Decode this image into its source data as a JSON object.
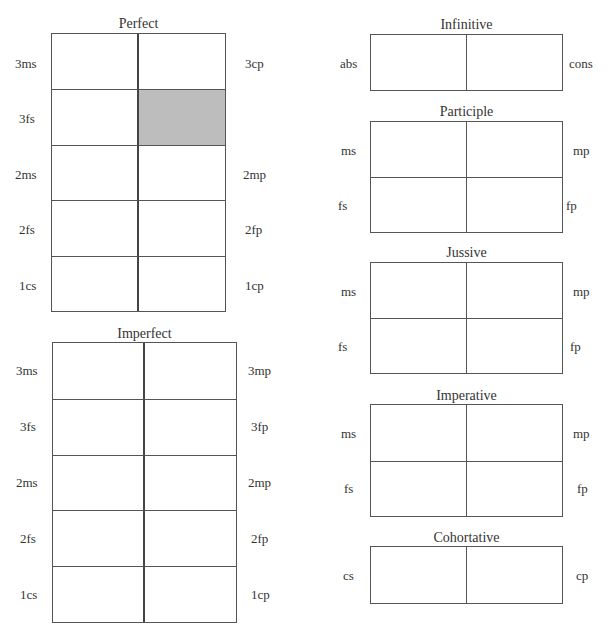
{
  "paradigms": {
    "perfect": {
      "title": "Perfect",
      "rows": [
        {
          "left": "3ms",
          "right": "3cp"
        },
        {
          "left": "3fs",
          "right": ""
        },
        {
          "left": "2ms",
          "right": "2mp"
        },
        {
          "left": "2fs",
          "right": "2fp"
        },
        {
          "left": "1cs",
          "right": "1cp"
        }
      ],
      "shaded_cells": [
        {
          "row": 1,
          "col": 1
        }
      ],
      "shade_color": "#bdbdbd"
    },
    "imperfect": {
      "title": "Imperfect",
      "rows": [
        {
          "left": "3ms",
          "right": "3mp"
        },
        {
          "left": "3fs",
          "right": "3fp"
        },
        {
          "left": "2ms",
          "right": "2mp"
        },
        {
          "left": "2fs",
          "right": "2fp"
        },
        {
          "left": "1cs",
          "right": "1cp"
        }
      ]
    },
    "infinitive": {
      "title": "Infinitive",
      "rows": [
        {
          "left": "abs",
          "right": "cons"
        }
      ]
    },
    "participle": {
      "title": "Participle",
      "rows": [
        {
          "left": "ms",
          "right": "mp"
        },
        {
          "left": "fs",
          "right": "fp"
        }
      ]
    },
    "jussive": {
      "title": "Jussive",
      "rows": [
        {
          "left": "ms",
          "right": "mp"
        },
        {
          "left": "fs",
          "right": "fp"
        }
      ]
    },
    "imperative": {
      "title": "Imperative",
      "rows": [
        {
          "left": "ms",
          "right": "mp"
        },
        {
          "left": "fs",
          "right": "fp"
        }
      ]
    },
    "cohortative": {
      "title": "Cohortative",
      "rows": [
        {
          "left": "cs",
          "right": "cp"
        }
      ]
    }
  }
}
